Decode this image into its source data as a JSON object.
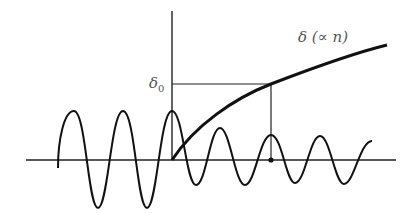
{
  "diagram": {
    "labels": {
      "curve_label": "δ (∝ n)",
      "delta0_symbol": "δ",
      "delta0_subscript": "0"
    },
    "colors": {
      "stroke": "#111111",
      "label": "#555555",
      "background": "#ffffff"
    },
    "elements": [
      "horizontal axis",
      "vertical axis",
      "oscillating wave (larger amplitude left of vertical axis, reduced amplitude right)",
      "thick growing curve starting at origin",
      "horizontal reference line at delta_0",
      "vertical drop line with dot on axis"
    ]
  }
}
